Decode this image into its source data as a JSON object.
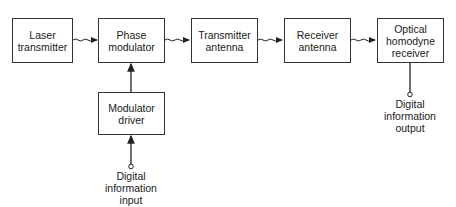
{
  "diagram": {
    "blocks": [
      {
        "id": "laser",
        "lines": [
          "Laser",
          "transmitter"
        ]
      },
      {
        "id": "phase_mod",
        "lines": [
          "Phase",
          "modulator"
        ]
      },
      {
        "id": "tx_antenna",
        "lines": [
          "Transmitter",
          "antenna"
        ]
      },
      {
        "id": "rx_antenna",
        "lines": [
          "Receiver",
          "antenna"
        ]
      },
      {
        "id": "homodyne",
        "lines": [
          "Optical",
          "homodyne",
          "receiver"
        ]
      },
      {
        "id": "mod_driver",
        "lines": [
          "Modulator",
          "driver"
        ]
      }
    ],
    "terminals": {
      "input": {
        "lines": [
          "Digital",
          "information",
          "input"
        ]
      },
      "output": {
        "lines": [
          "Digital",
          "information",
          "output"
        ]
      }
    },
    "connections": [
      {
        "from": "laser",
        "to": "phase_mod",
        "style": "wavy-arrow"
      },
      {
        "from": "phase_mod",
        "to": "tx_antenna",
        "style": "wavy-arrow"
      },
      {
        "from": "tx_antenna",
        "to": "rx_antenna",
        "style": "wavy-arrow"
      },
      {
        "from": "rx_antenna",
        "to": "homodyne",
        "style": "wavy-arrow"
      },
      {
        "from": "mod_driver",
        "to": "phase_mod",
        "style": "arrow"
      },
      {
        "from": "input",
        "to": "mod_driver",
        "style": "arrow"
      },
      {
        "from": "homodyne",
        "to": "output",
        "style": "line"
      }
    ]
  }
}
